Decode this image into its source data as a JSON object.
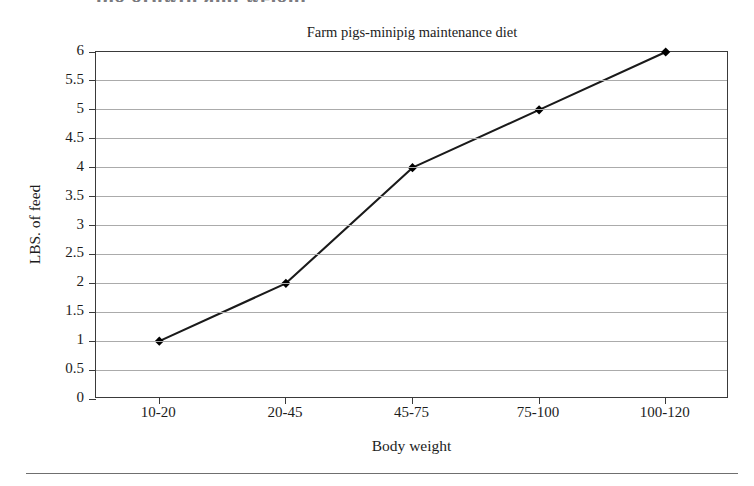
{
  "figure": {
    "page_fragment_text": "pig growth and weight",
    "bottom_rule": true
  },
  "chart_data": {
    "type": "line",
    "title": "Farm pigs-minipig maintenance diet",
    "xlabel": "Body weight",
    "ylabel": "LBS. of feed",
    "categories": [
      "10-20",
      "20-45",
      "45-75",
      "75-100",
      "100-120"
    ],
    "values": [
      1,
      2,
      4,
      5,
      6
    ],
    "series": [
      {
        "name": "LBS. of feed",
        "values": [
          1,
          2,
          4,
          5,
          6
        ],
        "line_color": "#1a1a1a",
        "marker": "diamond",
        "marker_color": "#000000"
      }
    ],
    "ylim": [
      0,
      6
    ],
    "ytick_step": 0.5,
    "yticks": [
      "0",
      "0.5",
      "1",
      "1.5",
      "2",
      "2.5",
      "3",
      "3.5",
      "4",
      "4.5",
      "5",
      "5.5",
      "6"
    ],
    "grid": true,
    "grid_color": "#ababab",
    "axis_color": "#3a3a3a",
    "legend": "none",
    "legend_position": "none",
    "background": "#ffffff"
  }
}
